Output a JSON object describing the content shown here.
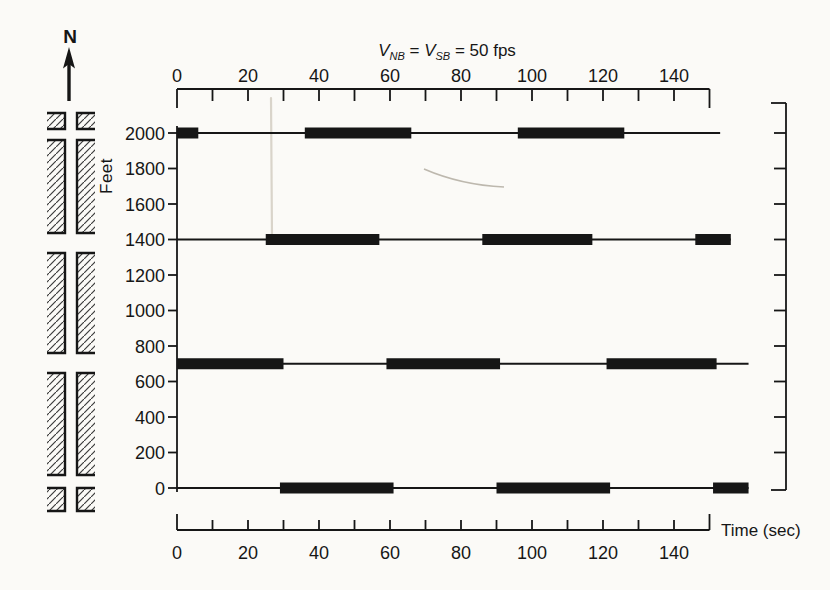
{
  "figure": {
    "background": "#fbfaf7",
    "ink": "#161616",
    "north_label": "N",
    "title_parts": [
      {
        "text": "V",
        "style": "var"
      },
      {
        "text": "NB",
        "style": "sub"
      },
      {
        "text": " = ",
        "style": "plain"
      },
      {
        "text": "V",
        "style": "var"
      },
      {
        "text": "SB",
        "style": "sub"
      },
      {
        "text": " = 50 fps",
        "style": "plain"
      }
    ],
    "street_map_px": {
      "left_column_x": [
        47,
        65
      ],
      "right_column_x": [
        77,
        95
      ],
      "block_y_ranges": [
        [
          113,
          129
        ],
        [
          140,
          233
        ],
        [
          253,
          353
        ],
        [
          373,
          475
        ],
        [
          488,
          511
        ]
      ]
    }
  },
  "chart_data": {
    "type": "time-space-diagram",
    "xlabel": "Time (sec)",
    "ylabel": "Feet",
    "x_range_sec": [
      0,
      150
    ],
    "x_major_ticks_sec": [
      0,
      20,
      40,
      60,
      80,
      100,
      120,
      140
    ],
    "x_minor_step_sec": 10,
    "y_range_ft": [
      0,
      2000
    ],
    "y_tick_step_ft": 200,
    "y_tick_labels": [
      0,
      200,
      400,
      600,
      800,
      1000,
      1200,
      1400,
      1600,
      1800,
      2000
    ],
    "progression_speed_fps": 50,
    "grid": false,
    "signals": [
      {
        "position_ft": 2000,
        "line_end_sec": 153,
        "red_intervals_sec": [
          [
            0,
            6
          ],
          [
            36,
            66
          ],
          [
            96,
            126
          ]
        ]
      },
      {
        "position_ft": 1400,
        "line_end_sec": 156,
        "red_intervals_sec": [
          [
            25,
            57
          ],
          [
            86,
            117
          ],
          [
            146,
            156
          ]
        ]
      },
      {
        "position_ft": 700,
        "line_end_sec": 161,
        "red_intervals_sec": [
          [
            0,
            30
          ],
          [
            59,
            91
          ],
          [
            121,
            152
          ]
        ]
      },
      {
        "position_ft": 0,
        "line_end_sec": 161,
        "red_intervals_sec": [
          [
            29,
            61
          ],
          [
            90,
            122
          ],
          [
            151,
            161
          ]
        ]
      }
    ]
  }
}
